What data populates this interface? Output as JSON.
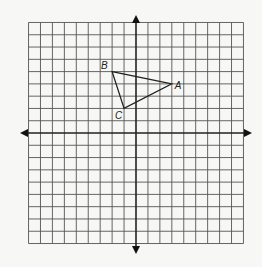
{
  "diagram": {
    "type": "coordinate-plane",
    "grid": {
      "x_min": -9,
      "x_max": 9,
      "y_min": -9,
      "y_max": 9,
      "origin_px": [
        136,
        133
      ],
      "cell_px": [
        11.94,
        12.28
      ],
      "line_color": "#555555",
      "axis_color": "#222222",
      "background": "#f7f7f5"
    },
    "triangle": {
      "vertices": [
        {
          "label": "A",
          "x": 3,
          "y": 4
        },
        {
          "label": "B",
          "x": -2,
          "y": 5
        },
        {
          "label": "C",
          "x": -1,
          "y": 2
        }
      ],
      "stroke": "#222222"
    },
    "labels": {
      "A": "A",
      "B": "B",
      "C": "C"
    }
  }
}
